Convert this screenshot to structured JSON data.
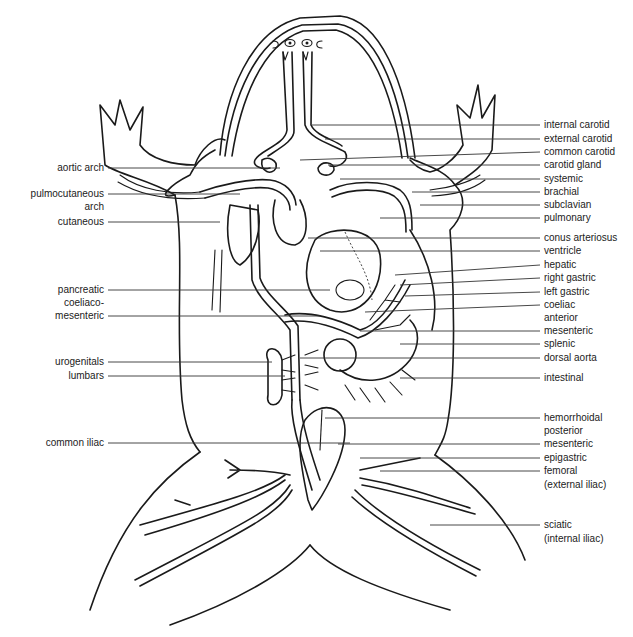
{
  "figure": {
    "line_color": "#1a1a1a",
    "background": "#ffffff"
  },
  "labels": {
    "right": [
      {
        "id": "internal-carotid",
        "text": "internal carotid",
        "y": 125
      },
      {
        "id": "external-carotid",
        "text": "external carotid",
        "y": 139
      },
      {
        "id": "common-carotid",
        "text": "common carotid",
        "y": 152
      },
      {
        "id": "carotid-gland",
        "text": "carotid gland",
        "y": 165
      },
      {
        "id": "systemic",
        "text": "systemic",
        "y": 179
      },
      {
        "id": "brachial",
        "text": "brachial",
        "y": 192
      },
      {
        "id": "subclavian",
        "text": "subclavian",
        "y": 205
      },
      {
        "id": "pulmonary",
        "text": "pulmonary",
        "y": 218
      },
      {
        "id": "conus-arteriosus",
        "text": "conus arteriosus",
        "y": 238
      },
      {
        "id": "ventricle",
        "text": "ventricle",
        "y": 251
      },
      {
        "id": "hepatic",
        "text": "hepatic",
        "y": 265
      },
      {
        "id": "right-gastric",
        "text": "right gastric",
        "y": 278
      },
      {
        "id": "left-gastric",
        "text": "left gastric",
        "y": 292
      },
      {
        "id": "coeliac",
        "text": "coeliac",
        "y": 305
      },
      {
        "id": "anterior",
        "text": "anterior",
        "y": 318,
        "no_line": true
      },
      {
        "id": "mesenteric",
        "text": "mesenteric",
        "y": 331
      },
      {
        "id": "splenic",
        "text": "splenic",
        "y": 344
      },
      {
        "id": "dorsal-aorta",
        "text": "dorsal aorta",
        "y": 358
      },
      {
        "id": "intestinal",
        "text": "intestinal",
        "y": 378
      },
      {
        "id": "hemorrhoidal",
        "text": "hemorrhoidal",
        "y": 418
      },
      {
        "id": "posterior",
        "text": "posterior",
        "y": 431,
        "no_line": true
      },
      {
        "id": "posterior-mesenteric",
        "text": "mesenteric",
        "y": 444
      },
      {
        "id": "epigastric",
        "text": "epigastric",
        "y": 458
      },
      {
        "id": "femoral",
        "text": "femoral",
        "y": 471
      },
      {
        "id": "femoral-sub",
        "text": "(external iliac)",
        "y": 485,
        "no_line": true
      },
      {
        "id": "sciatic",
        "text": "sciatic",
        "y": 525
      },
      {
        "id": "sciatic-sub",
        "text": "(internal iliac)",
        "y": 539,
        "no_line": true
      }
    ],
    "left": [
      {
        "id": "aortic-arch",
        "text": "aortic arch",
        "y": 168
      },
      {
        "id": "pulmocutaneous-arch",
        "text": "pulmocutaneous",
        "y": 194
      },
      {
        "id": "pulmocutaneous-arch-2",
        "text": "arch",
        "y": 207,
        "no_line": true
      },
      {
        "id": "cutaneous",
        "text": "cutaneous",
        "y": 222
      },
      {
        "id": "pancreatic",
        "text": "pancreatic",
        "y": 290
      },
      {
        "id": "coeliaco",
        "text": "coeliaco-",
        "y": 303,
        "no_line": true
      },
      {
        "id": "coeliaco-mesenteric",
        "text": "mesenteric",
        "y": 316
      },
      {
        "id": "urogenitals",
        "text": "urogenitals",
        "y": 362
      },
      {
        "id": "lumbars",
        "text": "lumbars",
        "y": 376
      },
      {
        "id": "common-iliac",
        "text": "common iliac",
        "y": 443
      }
    ]
  }
}
